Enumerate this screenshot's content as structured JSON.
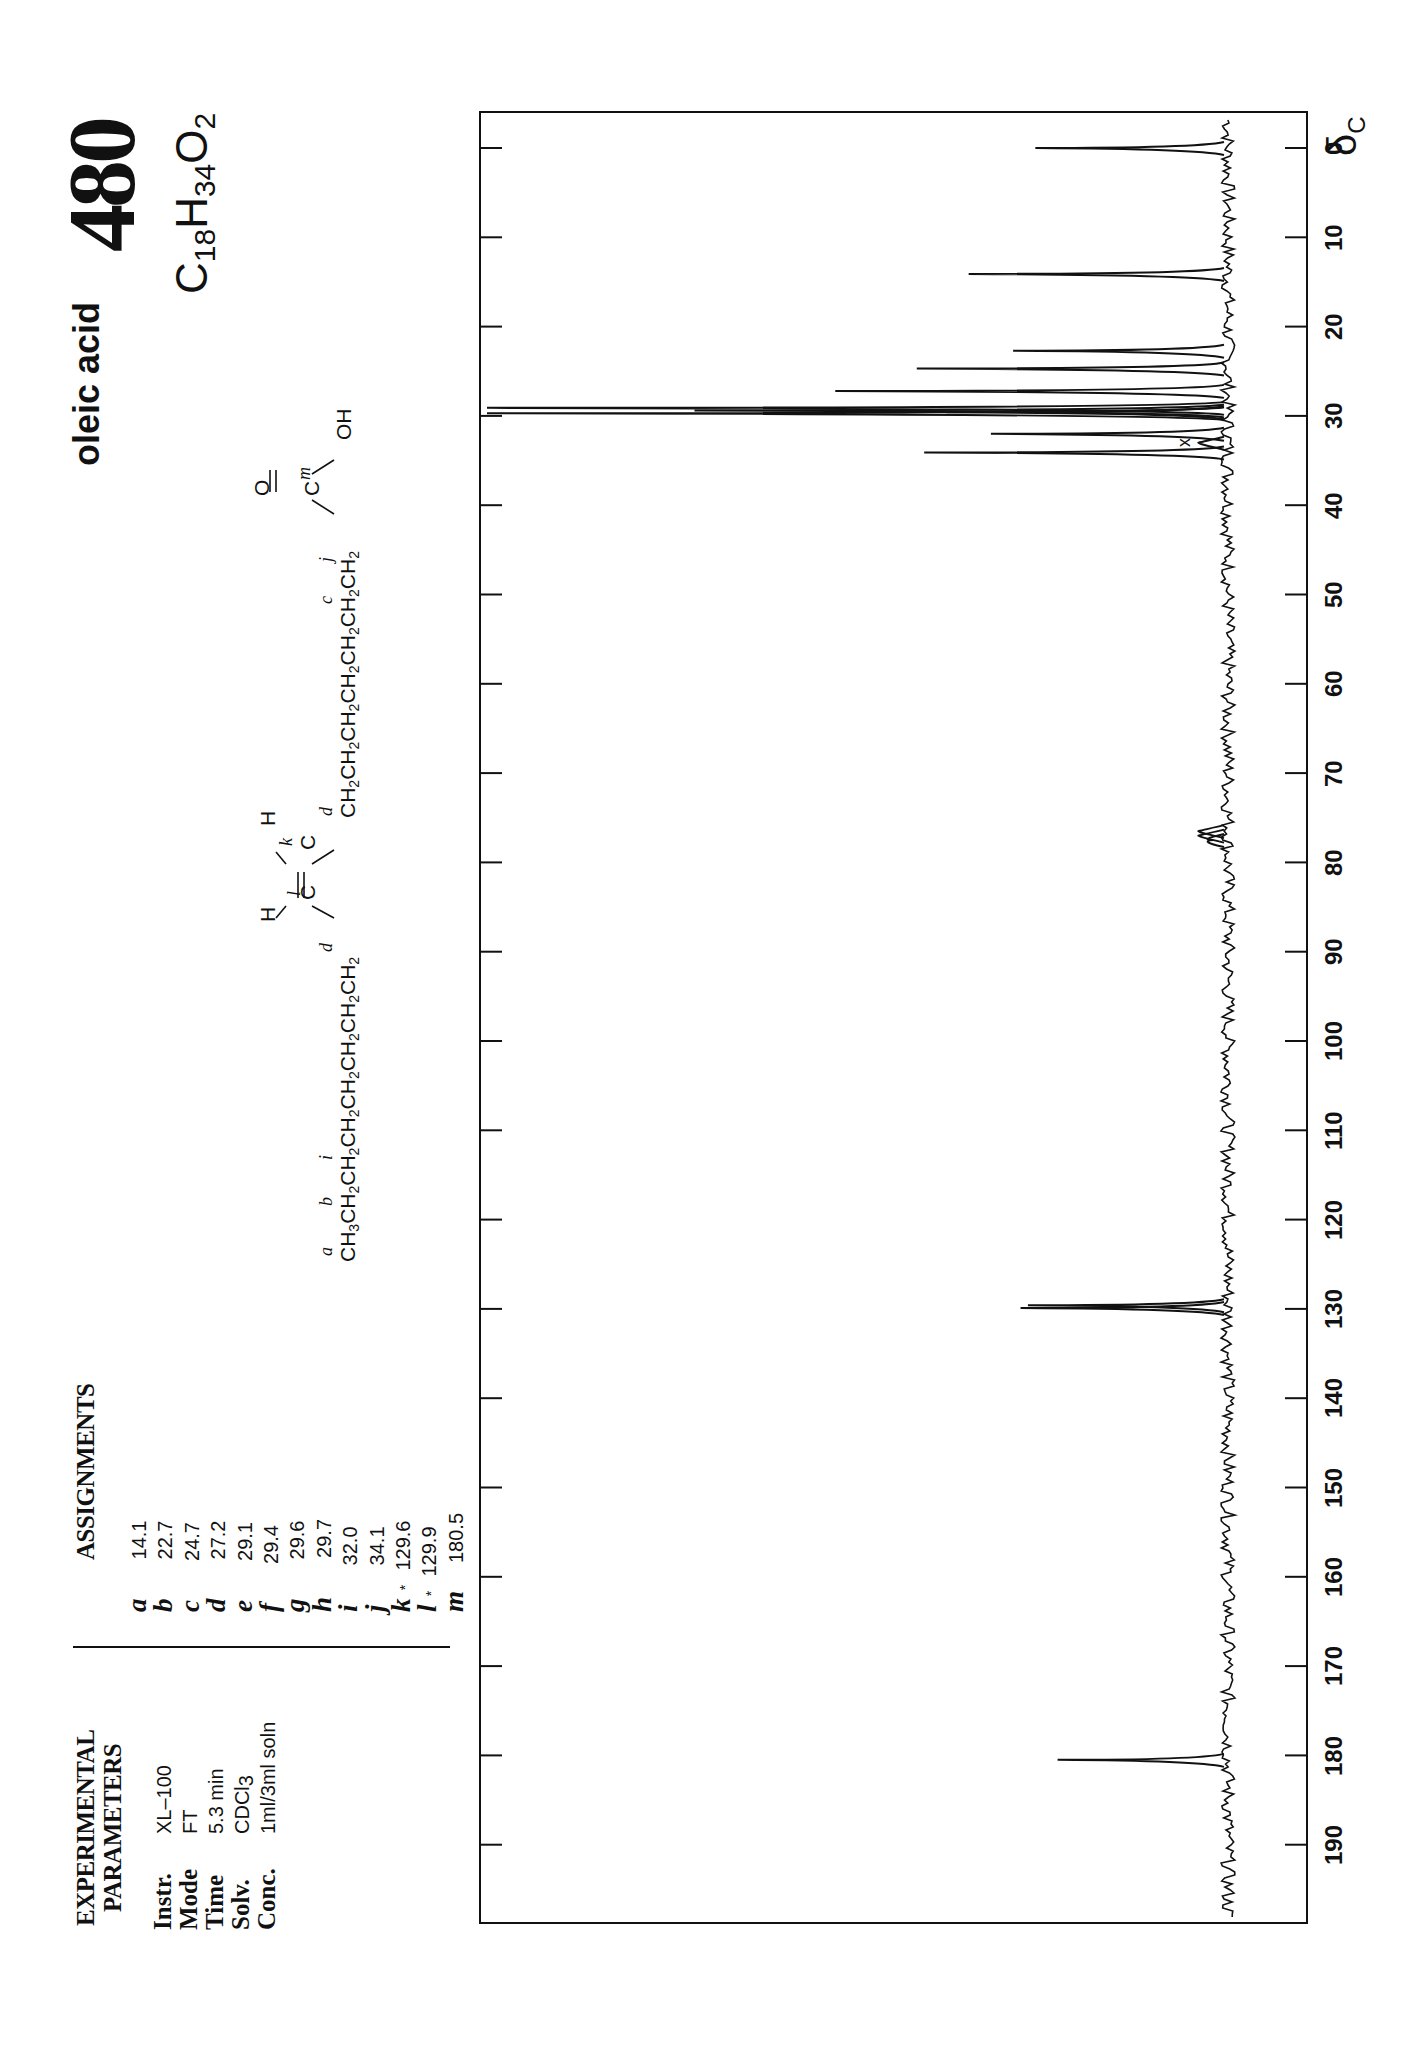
{
  "header": {
    "compound_name": "oleic acid",
    "entry_number": "480",
    "formula": {
      "C": "C",
      "c_count": "18",
      "H": "H",
      "h_count": "34",
      "O": "O",
      "o_count": "2"
    }
  },
  "structure": {
    "chain_left": "CH3CH2CH2CH2CH2CH2CH2CH2",
    "chain_right": "CH2CH2CH2CH2CH2CH2CH2",
    "acid_group": {
      "carbonyl_O": "O",
      "carbon": "C",
      "hydroxyl": "OH"
    },
    "alkene": {
      "left_H": "H",
      "right_H": "H",
      "left_C": "C",
      "right_C": "C"
    },
    "labels": {
      "a": "a",
      "b": "b",
      "i": "i",
      "d1": "d",
      "l": "l",
      "k": "k",
      "d2": "d",
      "c": "c",
      "j": "j",
      "m": "m"
    }
  },
  "assignments": {
    "heading": "ASSIGNMENTS",
    "rows": [
      {
        "letter": "a",
        "star": "",
        "value": "14.1"
      },
      {
        "letter": "b",
        "star": "",
        "value": "22.7"
      },
      {
        "letter": "c",
        "star": "",
        "value": "24.7"
      },
      {
        "letter": "d",
        "star": "",
        "value": "27.2"
      },
      {
        "letter": "e",
        "star": "",
        "value": "29.1"
      },
      {
        "letter": "f",
        "star": "",
        "value": "29.4"
      },
      {
        "letter": "g",
        "star": "",
        "value": "29.6"
      },
      {
        "letter": "h",
        "star": "",
        "value": "29.7"
      },
      {
        "letter": "i",
        "star": "",
        "value": "32.0"
      },
      {
        "letter": "j",
        "star": "",
        "value": "34.1"
      },
      {
        "letter": "k",
        "star": "*",
        "value": "129.6"
      },
      {
        "letter": "l",
        "star": "*",
        "value": "129.9"
      },
      {
        "letter": "m",
        "star": "",
        "value": "180.5"
      }
    ]
  },
  "experimental": {
    "heading_line1": "EXPERIMENTAL",
    "heading_line2": "PARAMETERS",
    "params": [
      {
        "label": "Instr.",
        "value": "XL–100"
      },
      {
        "label": "Mode",
        "value": "FT"
      },
      {
        "label": "Time",
        "value": "5.3 min"
      },
      {
        "label": "Solv.",
        "value": "CDCl",
        "sub": "3"
      },
      {
        "label": "Conc.",
        "value": "1ml/3ml soln"
      }
    ]
  },
  "axis": {
    "unit_symbol": "δ",
    "unit_sub": "C",
    "ticks": [
      "0",
      "10",
      "20",
      "30",
      "40",
      "50",
      "60",
      "70",
      "80",
      "90",
      "100",
      "110",
      "120",
      "130",
      "140",
      "150",
      "160",
      "170",
      "180",
      "190"
    ]
  },
  "impurity_marker": "x",
  "chart_data": {
    "type": "line",
    "xlabel": "δC (ppm)",
    "ylabel": "intensity (relative)",
    "xlim": [
      0,
      197
    ],
    "orientation": "page rotated 90°; chemical shift increases downward, intensity increases leftward",
    "grid": false,
    "series": [
      {
        "name": "13C spectrum peaks",
        "x": [
          0.0,
          14.1,
          22.7,
          24.7,
          27.2,
          29.1,
          29.4,
          29.6,
          29.7,
          32.0,
          33.0,
          34.1,
          76.5,
          77.0,
          77.5,
          129.6,
          129.9,
          180.5
        ],
        "y": [
          26,
          35,
          29,
          42,
          53,
          100,
          72,
          38,
          100,
          32,
          4,
          41,
          4,
          4,
          2,
          27,
          28,
          23
        ],
        "labels": [
          "TMS",
          "a",
          "b",
          "c",
          "d",
          "e",
          "f",
          "g",
          "h",
          "i",
          "x (impurity)",
          "j",
          "CDCl3",
          "CDCl3",
          "CDCl3",
          "k",
          "l",
          "m"
        ]
      }
    ]
  }
}
